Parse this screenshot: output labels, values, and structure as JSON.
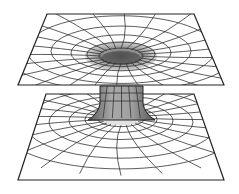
{
  "diagram": {
    "type": "wormhole-embedding-diagram",
    "colors": {
      "line": "#222222",
      "shade": "#9a9a9a",
      "background": "#ffffff"
    },
    "upper_sheet": {
      "corners": [
        [
          47,
          14
        ],
        [
          194,
          14
        ],
        [
          224,
          85
        ],
        [
          18,
          85
        ]
      ],
      "funnel_center": [
        121,
        56
      ],
      "rings": 5,
      "radial_lines": 12
    },
    "lower_sheet": {
      "corners": [
        [
          46,
          94
        ],
        [
          194,
          94
        ],
        [
          224,
          180
        ],
        [
          18,
          180
        ]
      ],
      "funnel_center": [
        121,
        118
      ],
      "rings": 5,
      "radial_lines": 12
    },
    "throat": {
      "x_left": 100,
      "x_right": 143,
      "y_top": 86,
      "y_bottom": 110
    }
  }
}
